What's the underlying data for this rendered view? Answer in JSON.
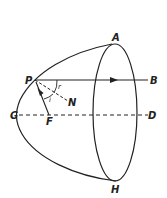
{
  "figure": {
    "points": {
      "A": "A",
      "B": "B",
      "P": "P",
      "N": "N",
      "G": "G",
      "F": "F",
      "D": "D",
      "H": "H"
    },
    "angles": {
      "incidence": "i",
      "reflection": "r"
    },
    "colors": {
      "stroke": "#222222",
      "background": "#ffffff"
    }
  }
}
